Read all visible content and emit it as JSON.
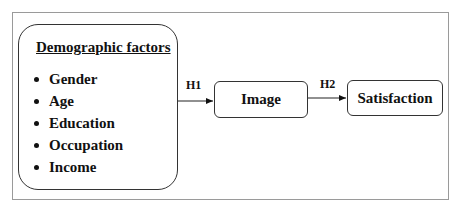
{
  "diagram": {
    "type": "conceptual-model",
    "demographics": {
      "title": "Demographic factors",
      "items": [
        "Gender",
        "Age",
        "Education",
        "Occupation",
        "Income"
      ]
    },
    "nodes": {
      "image": "Image",
      "satisfaction": "Satisfaction"
    },
    "edges": [
      {
        "from": "Demographic factors",
        "to": "Image",
        "label": "H1"
      },
      {
        "from": "Image",
        "to": "Satisfaction",
        "label": "H2"
      }
    ]
  }
}
